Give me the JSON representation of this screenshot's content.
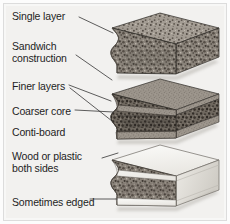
{
  "figure": {
    "background_color": "#f2f1ef",
    "frame_color": "#dcdcdc",
    "text_color": "#1e1e1e"
  },
  "labels": [
    {
      "id": "single-layer",
      "text": "Single layer",
      "x": 12,
      "y": 15
    },
    {
      "id": "sandwich",
      "text": "Sandwich",
      "x": 12,
      "y": 45
    },
    {
      "id": "construction",
      "text": "construction",
      "x": 12,
      "y": 57
    },
    {
      "id": "finer-layers",
      "text": "Finer layers",
      "x": 12,
      "y": 85
    },
    {
      "id": "coarser-core",
      "text": "Coarser core",
      "x": 12,
      "y": 110
    },
    {
      "id": "conti-board",
      "text": "Conti-board",
      "x": 12,
      "y": 131
    },
    {
      "id": "wood-or-plastic",
      "text": "Wood or plastic",
      "x": 12,
      "y": 155
    },
    {
      "id": "both-sides",
      "text": "both sides",
      "x": 12,
      "y": 167
    },
    {
      "id": "sometimes-edged",
      "text": "Sometimes edged",
      "x": 12,
      "y": 201
    }
  ],
  "boards": [
    {
      "id": "board-single-layer",
      "name": "Single layer chipboard block",
      "description": "Uniform coarse chipboard, cut-away wavy front face",
      "surface": "chipboard",
      "top_color": "#9a938b",
      "front_color": "#7d766e",
      "side_color": "#8c857d"
    },
    {
      "id": "board-sandwich",
      "name": "Sandwich construction chipboard block",
      "description": "Fine outer layers with coarser core between them",
      "surface": "chipboard-layered",
      "top_color": "#9a938b",
      "front_color": "#7d766e",
      "side_color": "#8c857d",
      "layers": [
        "Finer layers",
        "Coarser core",
        "Finer layers"
      ]
    },
    {
      "id": "board-conti",
      "name": "Conti-board faced block",
      "description": "Chipboard core faced with wood or plastic on both sides, edged",
      "surface": "veneered",
      "top_color": "#f4f3f0",
      "front_color": "#7d766e",
      "side_color": "#e2e0dc",
      "edge_color": "#ddd9d3"
    }
  ],
  "leaders": [
    {
      "id": "leader-single-layer",
      "from": "Single layer",
      "to": "board-single-layer"
    },
    {
      "id": "leader-sandwich",
      "from": "Sandwich construction",
      "to": "board-sandwich"
    },
    {
      "id": "leader-finer-layers",
      "from": "Finer layers",
      "to": "board-sandwich"
    },
    {
      "id": "leader-coarser-core",
      "from": "Coarser core",
      "to": "board-sandwich"
    },
    {
      "id": "leader-wood-or-plastic",
      "from": "Wood or plastic both sides",
      "to": "board-conti"
    },
    {
      "id": "leader-sometimes-edged",
      "from": "Sometimes edged",
      "to": "board-conti"
    }
  ]
}
